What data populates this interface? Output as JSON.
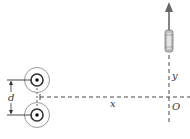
{
  "diagram": {
    "labels": {
      "separation": "d",
      "horizontal_distance": "x",
      "vertical_axis": "y",
      "origin": "O"
    },
    "elements": {
      "wires": [
        {
          "name": "top-wire",
          "current_direction": "out-of-page"
        },
        {
          "name": "bottom-wire",
          "current_direction": "out-of-page"
        }
      ],
      "particle": {
        "name": "moving-particle",
        "direction": "+y"
      }
    },
    "colors": {
      "line": "#333333",
      "circle_outer": "#999999",
      "particle_body": "#b8b8b8",
      "arrow": "#666666"
    }
  }
}
